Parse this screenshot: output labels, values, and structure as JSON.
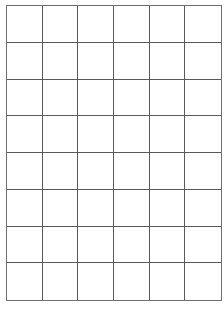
{
  "grid": {
    "columns": 6,
    "rows": 8,
    "line_color": "#5a5a5a",
    "background": "#ffffff",
    "cells": [
      [
        "",
        "",
        "",
        "",
        "",
        ""
      ],
      [
        "",
        "",
        "",
        "",
        "",
        ""
      ],
      [
        "",
        "",
        "",
        "",
        "",
        ""
      ],
      [
        "",
        "",
        "",
        "",
        "",
        ""
      ],
      [
        "",
        "",
        "",
        "",
        "",
        ""
      ],
      [
        "",
        "",
        "",
        "",
        "",
        ""
      ],
      [
        "",
        "",
        "",
        "",
        "",
        ""
      ],
      [
        "",
        "",
        "",
        "",
        "",
        ""
      ]
    ]
  }
}
